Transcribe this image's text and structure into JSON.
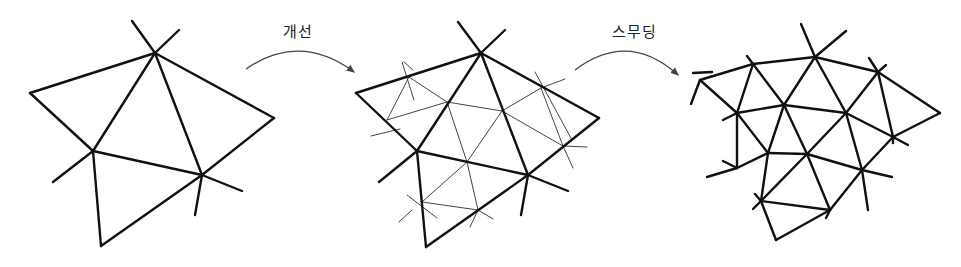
{
  "diagram": {
    "steps": [
      {
        "label": "개선",
        "x": 283,
        "y": 20
      },
      {
        "label": "스무딩",
        "x": 612,
        "y": 20
      }
    ],
    "colors": {
      "line": "#111111",
      "thin": "#444444",
      "arrow": "#444444"
    },
    "meshes": {
      "initial": {
        "edges": [
          [
            155,
            53,
            30,
            93
          ],
          [
            30,
            93,
            93,
            151
          ],
          [
            155,
            53,
            274,
            118
          ],
          [
            274,
            118,
            202,
            175
          ],
          [
            155,
            53,
            93,
            151
          ],
          [
            155,
            53,
            202,
            175
          ],
          [
            93,
            151,
            202,
            175
          ],
          [
            93,
            151,
            101,
            246
          ],
          [
            101,
            246,
            202,
            175
          ],
          [
            132,
            21,
            155,
            53
          ],
          [
            179,
            30,
            155,
            53
          ],
          [
            93,
            151,
            53,
            182
          ],
          [
            202,
            175,
            242,
            191
          ],
          [
            202,
            175,
            195,
            215
          ]
        ]
      },
      "refined": {
        "thick": [
          [
            481,
            53,
            356,
            93
          ],
          [
            356,
            93,
            417,
            151
          ],
          [
            481,
            53,
            599,
            118
          ],
          [
            599,
            118,
            528,
            175
          ],
          [
            481,
            53,
            417,
            151
          ],
          [
            481,
            53,
            528,
            175
          ],
          [
            417,
            151,
            528,
            175
          ],
          [
            417,
            151,
            426,
            247
          ],
          [
            426,
            247,
            528,
            175
          ],
          [
            458,
            22,
            481,
            53
          ],
          [
            505,
            30,
            481,
            53
          ],
          [
            417,
            151,
            379,
            182
          ],
          [
            528,
            175,
            568,
            191
          ],
          [
            528,
            175,
            521,
            215
          ]
        ],
        "thin": [
          [
            409,
            77,
            387,
            120
          ],
          [
            409,
            77,
            447,
            102
          ],
          [
            387,
            120,
            447,
            102
          ],
          [
            447,
            102,
            502,
            111
          ],
          [
            502,
            111,
            541,
            88
          ],
          [
            541,
            88,
            563,
            146
          ],
          [
            502,
            111,
            563,
            146
          ],
          [
            447,
            102,
            467,
            162
          ],
          [
            467,
            162,
            502,
            111
          ],
          [
            467,
            162,
            422,
            202
          ],
          [
            467,
            162,
            478,
            210
          ],
          [
            422,
            202,
            478,
            210
          ],
          [
            400,
            129,
            371,
            136
          ],
          [
            402,
            62,
            414,
            100
          ],
          [
            404,
            62,
            413,
            70
          ],
          [
            535,
            72,
            572,
            140
          ],
          [
            563,
            146,
            587,
            147
          ],
          [
            541,
            88,
            565,
            79
          ],
          [
            563,
            146,
            573,
            168
          ],
          [
            407,
            195,
            437,
            218
          ],
          [
            412,
            210,
            399,
            222
          ],
          [
            478,
            210,
            493,
            219
          ],
          [
            478,
            210,
            470,
            227
          ]
        ]
      },
      "smoothed": {
        "edges": [
          [
            700,
            80,
            753,
            64
          ],
          [
            753,
            64,
            815,
            57
          ],
          [
            815,
            57,
            878,
            72
          ],
          [
            878,
            72,
            940,
            113
          ],
          [
            700,
            80,
            737,
            113
          ],
          [
            753,
            64,
            737,
            113
          ],
          [
            753,
            64,
            784,
            105
          ],
          [
            815,
            57,
            784,
            105
          ],
          [
            815,
            57,
            846,
            113
          ],
          [
            878,
            72,
            846,
            113
          ],
          [
            878,
            72,
            893,
            137
          ],
          [
            940,
            113,
            893,
            137
          ],
          [
            737,
            113,
            784,
            105
          ],
          [
            784,
            105,
            846,
            113
          ],
          [
            846,
            113,
            893,
            137
          ],
          [
            737,
            113,
            737,
            168
          ],
          [
            737,
            113,
            768,
            153
          ],
          [
            784,
            105,
            768,
            153
          ],
          [
            784,
            105,
            807,
            154
          ],
          [
            846,
            113,
            807,
            154
          ],
          [
            846,
            113,
            862,
            170
          ],
          [
            893,
            137,
            862,
            170
          ],
          [
            737,
            168,
            768,
            153
          ],
          [
            768,
            153,
            807,
            154
          ],
          [
            807,
            154,
            862,
            170
          ],
          [
            768,
            153,
            761,
            201
          ],
          [
            807,
            154,
            761,
            201
          ],
          [
            807,
            154,
            830,
            210
          ],
          [
            862,
            170,
            830,
            210
          ],
          [
            761,
            201,
            830,
            210
          ],
          [
            761,
            201,
            776,
            240
          ],
          [
            776,
            240,
            830,
            210
          ],
          [
            801,
            24,
            815,
            57
          ],
          [
            846,
            31,
            815,
            57
          ],
          [
            700,
            80,
            691,
            104
          ],
          [
            693,
            73,
            712,
            72
          ],
          [
            737,
            168,
            707,
            177
          ],
          [
            723,
            161,
            737,
            168
          ],
          [
            737,
            113,
            723,
            120
          ],
          [
            862,
            170,
            868,
            210
          ],
          [
            862,
            170,
            892,
            177
          ],
          [
            893,
            137,
            908,
            145
          ],
          [
            893,
            137,
            893,
            143
          ],
          [
            878,
            72,
            869,
            58
          ],
          [
            878,
            72,
            886,
            65
          ],
          [
            753,
            64,
            747,
            56
          ],
          [
            761,
            201,
            753,
            209
          ],
          [
            830,
            210,
            826,
            218
          ],
          [
            761,
            201,
            755,
            194
          ]
        ]
      }
    },
    "arrows": [
      {
        "from": [
          246,
          69
        ],
        "ctrl": [
          300,
          32
        ],
        "to": [
          354,
          72
        ]
      },
      {
        "from": [
          575,
          70
        ],
        "ctrl": [
          628,
          30
        ],
        "to": [
          678,
          75
        ]
      }
    ]
  }
}
